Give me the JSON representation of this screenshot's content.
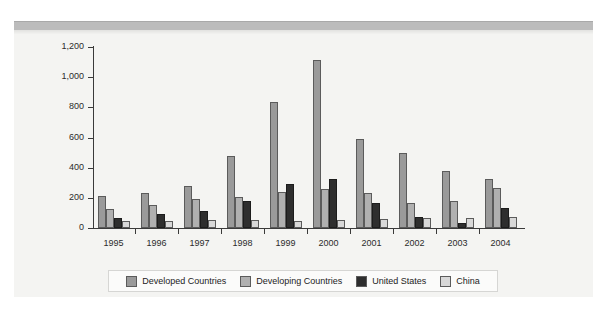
{
  "chart_data": {
    "type": "bar",
    "title": "",
    "subtitle": "",
    "xlabel": "",
    "ylabel": "",
    "ylim": [
      0,
      1200
    ],
    "ytick_labels": [
      "1,200",
      "1,000",
      "800",
      "600",
      "400",
      "200",
      "0"
    ],
    "yticks": [
      1200,
      1000,
      800,
      600,
      400,
      200,
      0
    ],
    "grid": false,
    "legend_position": "bottom",
    "categories": [
      "1995",
      "1996",
      "1997",
      "1998",
      "1999",
      "2000",
      "2001",
      "2002",
      "2003",
      "2004"
    ],
    "series": [
      {
        "name": "Developed Countries",
        "color": "#9a9a9a",
        "values": [
          215,
          230,
          280,
          478,
          835,
          1115,
          588,
          500,
          378,
          328
        ]
      },
      {
        "name": "Developing Countries",
        "color": "#b0b0b0",
        "values": [
          125,
          155,
          190,
          205,
          240,
          260,
          232,
          165,
          182,
          265
        ]
      },
      {
        "name": "United States",
        "color": "#2e2e2e",
        "values": [
          65,
          95,
          112,
          182,
          290,
          322,
          168,
          72,
          35,
          130
        ]
      },
      {
        "name": "China",
        "color": "#d8d8d8",
        "values": [
          45,
          45,
          50,
          52,
          45,
          52,
          58,
          68,
          66,
          72
        ]
      }
    ]
  },
  "legend": {
    "items": [
      {
        "label": "Developed Countries"
      },
      {
        "label": "Developing Countries"
      },
      {
        "label": "United States"
      },
      {
        "label": "China"
      }
    ]
  }
}
